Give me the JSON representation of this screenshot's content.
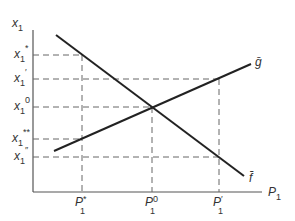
{
  "diagram": {
    "axes": {
      "y_label": "x",
      "y_label_sub": "1",
      "x_label": "P",
      "x_label_sub": "1"
    },
    "y_ticks": [
      {
        "main": "x",
        "sub": "1",
        "sup": "*"
      },
      {
        "main": "x",
        "sub": "1",
        "sup": "′"
      },
      {
        "main": "x",
        "sub": "1",
        "sup": "0"
      },
      {
        "main": "x",
        "sub": "1",
        "sup": "**"
      },
      {
        "main": "x",
        "sub": "1",
        "sup": "″"
      }
    ],
    "x_ticks": [
      {
        "main": "P",
        "sub": "1",
        "sup": "*"
      },
      {
        "main": "P",
        "sub": "1",
        "sup": "0"
      },
      {
        "main": "P",
        "sub": "1",
        "sup": "′"
      }
    ],
    "curves": [
      {
        "name": "f",
        "label": "f̄",
        "direction": "downward-sloping"
      },
      {
        "name": "g",
        "label": "ḡ",
        "direction": "upward-sloping"
      }
    ]
  }
}
